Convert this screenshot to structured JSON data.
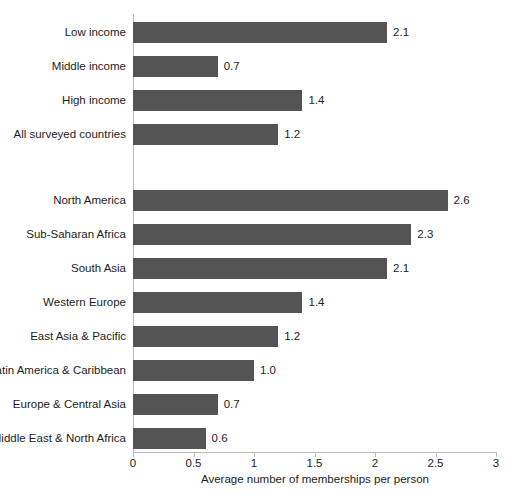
{
  "chart_data": {
    "type": "bar",
    "orientation": "horizontal",
    "title": "",
    "xlabel": "Average number of memberships per person",
    "ylabel": "",
    "xlim": [
      0,
      3
    ],
    "xticks": [
      "0",
      "0.5",
      "1",
      "1.5",
      "2",
      "2.5",
      "3"
    ],
    "xtick_values": [
      0,
      0.5,
      1,
      1.5,
      2,
      2.5,
      3
    ],
    "grid": false,
    "legend": "none",
    "bar_color": "#545454",
    "axis_color": "#b9b9b9",
    "groups": [
      {
        "name": "income",
        "categories": [
          "Low income",
          "Middle income",
          "High income",
          "All surveyed countries"
        ],
        "values": [
          2.1,
          0.7,
          1.4,
          1.2
        ],
        "labels": [
          "2.1",
          "0.7",
          "1.4",
          "1.2"
        ]
      },
      {
        "name": "region",
        "categories": [
          "North America",
          "Sub-Saharan Africa",
          "South Asia",
          "Western Europe",
          "East Asia & Pacific",
          "Latin America & Caribbean",
          "Europe & Central Asia",
          "Middle East & North Africa"
        ],
        "values": [
          2.6,
          2.3,
          2.1,
          1.4,
          1.2,
          1.0,
          0.7,
          0.6
        ],
        "labels": [
          "2.6",
          "2.3",
          "2.1",
          "1.4",
          "1.2",
          "1.0",
          "0.7",
          "0.6"
        ]
      }
    ],
    "categories": [
      "Low income",
      "Middle income",
      "High income",
      "All surveyed countries",
      "North America",
      "Sub-Saharan Africa",
      "South Asia",
      "Western Europe",
      "East Asia & Pacific",
      "Latin America & Caribbean",
      "Europe & Central Asia",
      "Middle East & North Africa"
    ],
    "values": [
      2.1,
      0.7,
      1.4,
      1.2,
      2.6,
      2.3,
      2.1,
      1.4,
      1.2,
      1.0,
      0.7,
      0.6
    ],
    "data_labels": [
      "2.1",
      "0.7",
      "1.4",
      "1.2",
      "2.6",
      "2.3",
      "2.1",
      "1.4",
      "1.2",
      "1.0",
      "0.7",
      "0.6"
    ]
  }
}
